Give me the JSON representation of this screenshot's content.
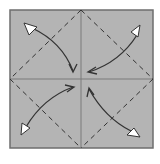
{
  "diagram": {
    "paper_color": "#b4b4b4",
    "border_color": "#6e6e6e",
    "crease_color": "#7a7a7a",
    "valley_line_color": "#333333",
    "arrow_color": "#333333",
    "arrowhead_fill": "#ffffff",
    "creases": [
      "horizontal-center",
      "vertical-center"
    ],
    "valley_folds": [
      "top-left-diagonal",
      "top-right-diagonal",
      "bottom-left-diagonal",
      "bottom-right-diagonal"
    ],
    "arrows": [
      {
        "name": "top-left-corner-arrow",
        "from": "top-left-corner",
        "to": "center"
      },
      {
        "name": "top-right-corner-arrow",
        "from": "top-right-corner",
        "to": "center"
      },
      {
        "name": "bottom-left-corner-arrow",
        "from": "bottom-left-corner",
        "to": "center"
      },
      {
        "name": "bottom-right-corner-arrow",
        "from": "bottom-right-corner",
        "to": "center"
      }
    ]
  }
}
